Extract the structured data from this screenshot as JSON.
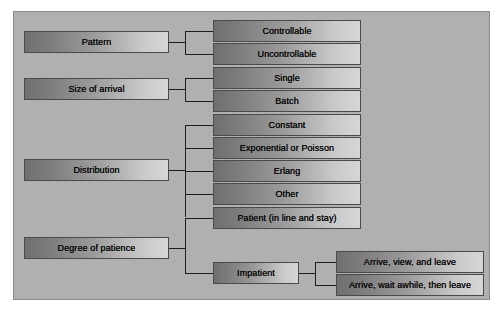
{
  "diagram": {
    "background_color": "#b0b0b0",
    "frame_border_color": "#8a8a8a",
    "node_border_color": "#4a4a4a",
    "node_gradient_from": "#6f6f6f",
    "node_gradient_to": "#d6d6d6",
    "connector_color": "#1e1e1e",
    "text_color": "#0d0d0d"
  },
  "categories": [
    {
      "key": "pattern",
      "label": "Pattern",
      "children": [
        {
          "key": "controllable",
          "label": "Controllable"
        },
        {
          "key": "uncontrollable",
          "label": "Uncontrollable"
        }
      ]
    },
    {
      "key": "size-of-arrival",
      "label": "Size of arrival",
      "children": [
        {
          "key": "single",
          "label": "Single"
        },
        {
          "key": "batch",
          "label": "Batch"
        }
      ]
    },
    {
      "key": "distribution",
      "label": "Distribution",
      "children": [
        {
          "key": "constant",
          "label": "Constant"
        },
        {
          "key": "exponential-or-poisson",
          "label": "Exponential or Poisson"
        },
        {
          "key": "erlang",
          "label": "Erlang"
        },
        {
          "key": "other",
          "label": "Other"
        }
      ]
    },
    {
      "key": "degree-of-patience",
      "label": "Degree of patience",
      "children": [
        {
          "key": "patient",
          "label": "Patient (in line and stay)"
        },
        {
          "key": "impatient",
          "label": "Impatient",
          "children": [
            {
              "key": "arrive-view-and-leave",
              "label": "Arrive, view, and leave"
            },
            {
              "key": "arrive-wait-awhile-then-leave",
              "label": "Arrive, wait awhile, then leave"
            }
          ]
        }
      ]
    }
  ]
}
